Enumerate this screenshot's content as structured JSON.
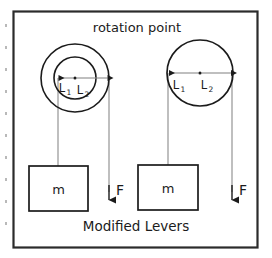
{
  "figure": {
    "title": "rotation point",
    "caption": "Modified Levers",
    "border_color": "#2b2b2b",
    "stroke_color": "#1b1b1b",
    "thin_line_color": "#8a8a8a",
    "background": "#ffffff"
  },
  "diagram": {
    "type": "physics-lever-diagram",
    "systems": [
      {
        "id": "left-system",
        "name": "concentric-wheel-lever",
        "wheel": {
          "center_label": "rotation point",
          "outer_radius_px": 34,
          "inner_radius_px": 21,
          "circles": 2
        },
        "dimensions": [
          {
            "label": "L",
            "subscript": "1",
            "side": "left",
            "ends_at": "inner-circle-edge"
          },
          {
            "label": "L",
            "subscript": "2",
            "side": "right",
            "ends_at": "outer-circle-edge"
          }
        ],
        "mass": {
          "label": "m"
        },
        "force": {
          "label": "F",
          "direction": "down"
        }
      },
      {
        "id": "right-system",
        "name": "single-wheel-lever",
        "wheel": {
          "center_label": "rotation point",
          "outer_radius_px": 33,
          "inner_radius_px": 0,
          "circles": 1
        },
        "dimensions": [
          {
            "label": "L",
            "subscript": "1",
            "side": "left",
            "ends_at": "circle-edge"
          },
          {
            "label": "L",
            "subscript": "2",
            "side": "right",
            "ends_at": "circle-edge"
          }
        ],
        "mass": {
          "label": "m"
        },
        "force": {
          "label": "F",
          "direction": "down"
        }
      }
    ]
  },
  "labels": {
    "L": "L",
    "sub1": "1",
    "sub2": "2",
    "mass": "m",
    "force": "F"
  }
}
